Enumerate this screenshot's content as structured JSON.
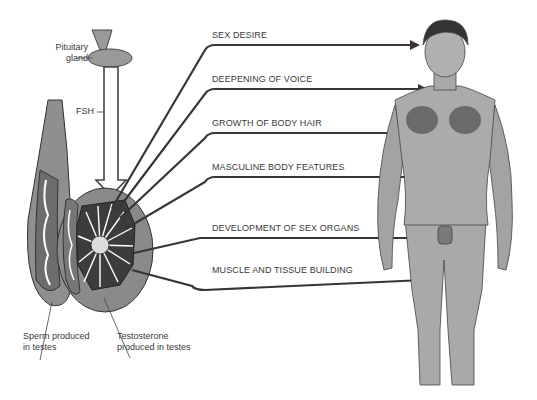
{
  "diagram": {
    "left_labels": {
      "pituitary": [
        "Pituitary",
        "gland"
      ],
      "fsh": "FSH",
      "sperm": [
        "Sperm produced",
        "in testes"
      ],
      "testosterone": [
        "Testosterone",
        "produced in testes"
      ]
    },
    "effects": [
      {
        "label": "SEX DESIRE",
        "y": 45,
        "target": "head"
      },
      {
        "label": "DEEPENING OF VOICE",
        "y": 89,
        "target": "throat"
      },
      {
        "label": "GROWTH OF BODY HAIR",
        "y": 133,
        "target": "chest"
      },
      {
        "label": "MASCULINE BODY FEATURES",
        "y": 177,
        "target": "abdomen"
      },
      {
        "label": "DEVELOPMENT OF SEX ORGANS",
        "y": 238,
        "target": "genitals"
      },
      {
        "label": "MUSCLE AND TISSUE BUILDING",
        "y": 280,
        "target": "thigh"
      }
    ],
    "colors": {
      "line": "#3b3434",
      "body_fill": "#a9a9a9",
      "testis_fill": "#8c8c8c",
      "text": "#3a3a3a"
    }
  }
}
